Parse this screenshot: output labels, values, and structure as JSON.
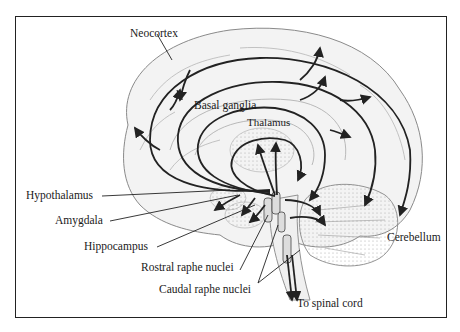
{
  "figure": {
    "labels": {
      "neocortex": "Neocortex",
      "basal_ganglia": "Basal ganglia",
      "thalamus": "Thalamus",
      "hypothalamus": "Hypothalamus",
      "amygdala": "Amygdala",
      "hippocampus": "Hippocampus",
      "rostral_raphe": "Rostral raphe nuclei",
      "caudal_raphe": "Caudal raphe nuclei",
      "spinal_cord": "To spinal cord",
      "cerebellum": "Cerebellum"
    },
    "colors": {
      "line": "#222222",
      "brain_fill": "#f2f2f2",
      "brain_outline": "#8a8a8a",
      "frame": "#222222"
    }
  }
}
